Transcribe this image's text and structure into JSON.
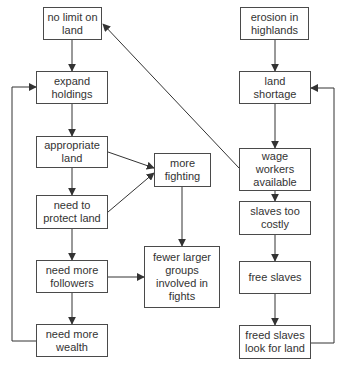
{
  "diagram": {
    "type": "flowchart",
    "colors": {
      "line": "#333333",
      "border": "#4a4a4a",
      "text": "#333333",
      "background": "#ffffff"
    },
    "nodes": [
      {
        "id": "no_limit",
        "label": "no limit on land",
        "x": 43,
        "y": 7,
        "w": 59,
        "h": 33
      },
      {
        "id": "expand",
        "label": "expand holdings",
        "x": 36,
        "y": 71,
        "w": 72,
        "h": 33
      },
      {
        "id": "appropriate",
        "label": "appropriate land",
        "x": 36,
        "y": 136,
        "w": 72,
        "h": 32
      },
      {
        "id": "protect",
        "label": "need to protect land",
        "x": 36,
        "y": 195,
        "w": 72,
        "h": 34
      },
      {
        "id": "followers",
        "label": "need more followers",
        "x": 36,
        "y": 260,
        "w": 72,
        "h": 33
      },
      {
        "id": "wealth",
        "label": "need more wealth",
        "x": 36,
        "y": 324,
        "w": 72,
        "h": 33
      },
      {
        "id": "fighting",
        "label": "more fighting",
        "x": 154,
        "y": 153,
        "w": 57,
        "h": 34
      },
      {
        "id": "fewer",
        "label": "fewer larger groups involved in fights",
        "x": 144,
        "y": 246,
        "w": 76,
        "h": 62
      },
      {
        "id": "erosion",
        "label": "erosion in highlands",
        "x": 240,
        "y": 7,
        "w": 69,
        "h": 33
      },
      {
        "id": "shortage",
        "label": "land shortage",
        "x": 239,
        "y": 71,
        "w": 72,
        "h": 33
      },
      {
        "id": "wage",
        "label": "wage workers available",
        "x": 239,
        "y": 148,
        "w": 72,
        "h": 43
      },
      {
        "id": "costly",
        "label": "slaves too costly",
        "x": 239,
        "y": 201,
        "w": 72,
        "h": 34
      },
      {
        "id": "free",
        "label": "free slaves",
        "x": 239,
        "y": 261,
        "w": 72,
        "h": 33
      },
      {
        "id": "freed",
        "label": "freed slaves look for land",
        "x": 239,
        "y": 325,
        "w": 72,
        "h": 34
      }
    ],
    "edges": [
      {
        "from": "no_limit",
        "to": "expand",
        "points": [
          [
            72,
            40
          ],
          [
            72,
            71
          ]
        ]
      },
      {
        "from": "expand",
        "to": "appropriate",
        "points": [
          [
            72,
            104
          ],
          [
            72,
            136
          ]
        ]
      },
      {
        "from": "appropriate",
        "to": "protect",
        "points": [
          [
            72,
            168
          ],
          [
            72,
            195
          ]
        ]
      },
      {
        "from": "protect",
        "to": "followers",
        "points": [
          [
            72,
            229
          ],
          [
            72,
            260
          ]
        ]
      },
      {
        "from": "followers",
        "to": "wealth",
        "points": [
          [
            72,
            293
          ],
          [
            72,
            324
          ]
        ]
      },
      {
        "from": "wealth",
        "to": "expand",
        "points": [
          [
            36,
            341
          ],
          [
            12,
            341
          ],
          [
            12,
            87
          ],
          [
            36,
            87
          ]
        ]
      },
      {
        "from": "appropriate",
        "to": "fighting",
        "points": [
          [
            108,
            152
          ],
          [
            154,
            168
          ]
        ]
      },
      {
        "from": "protect",
        "to": "fighting",
        "points": [
          [
            108,
            212
          ],
          [
            154,
            173
          ]
        ]
      },
      {
        "from": "fighting",
        "to": "fewer",
        "points": [
          [
            182,
            187
          ],
          [
            182,
            246
          ]
        ]
      },
      {
        "from": "followers",
        "to": "fewer",
        "points": [
          [
            108,
            277
          ],
          [
            144,
            277
          ]
        ]
      },
      {
        "from": "erosion",
        "to": "shortage",
        "points": [
          [
            275,
            40
          ],
          [
            275,
            71
          ]
        ]
      },
      {
        "from": "shortage",
        "to": "wage",
        "points": [
          [
            275,
            104
          ],
          [
            275,
            148
          ]
        ]
      },
      {
        "from": "wage",
        "to": "no_limit",
        "points": [
          [
            239,
            168
          ],
          [
            103,
            24
          ]
        ]
      },
      {
        "from": "wage",
        "to": "costly",
        "points": [
          [
            275,
            191
          ],
          [
            275,
            201
          ]
        ]
      },
      {
        "from": "costly",
        "to": "free",
        "points": [
          [
            275,
            235
          ],
          [
            275,
            261
          ]
        ]
      },
      {
        "from": "free",
        "to": "freed",
        "points": [
          [
            275,
            294
          ],
          [
            275,
            325
          ]
        ]
      },
      {
        "from": "freed",
        "to": "shortage",
        "points": [
          [
            311,
            343
          ],
          [
            334,
            343
          ],
          [
            334,
            88
          ],
          [
            311,
            88
          ]
        ]
      }
    ]
  }
}
